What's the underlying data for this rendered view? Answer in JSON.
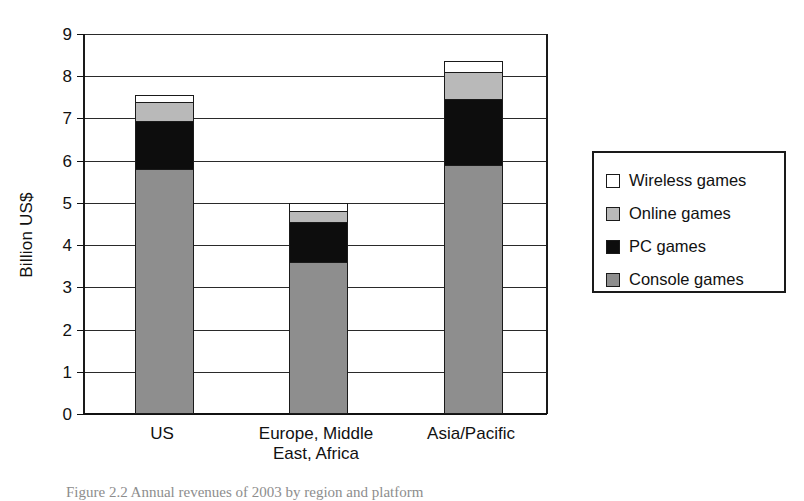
{
  "chart": {
    "type": "bar",
    "ylabel": "Billion US$",
    "caption": "Figure 2.2  Annual revenues of 2003 by region and platform"
  },
  "axis": {
    "ticks": [
      "9",
      "8",
      "7",
      "6",
      "5",
      "4",
      "3",
      "2",
      "1",
      "0"
    ]
  },
  "legend": {
    "items": [
      {
        "label": "Wireless games",
        "swatch": "swatch-wireless",
        "color": "#ffffff"
      },
      {
        "label": "Online games",
        "swatch": "swatch-online",
        "color": "#b9b9b9"
      },
      {
        "label": "PC games",
        "swatch": "swatch-pc",
        "color": "#0d0d0d"
      },
      {
        "label": "Console games",
        "swatch": "swatch-console",
        "color": "#8e8e8e"
      }
    ]
  },
  "categories": [
    {
      "label": "US"
    },
    {
      "label": "Europe, Middle\nEast, Africa"
    },
    {
      "label": "Asia/Pacific"
    }
  ],
  "chart_data": {
    "type": "bar",
    "subtype": "stacked",
    "title": "",
    "xlabel": "",
    "ylabel": "Billion US$",
    "ylim": [
      0,
      9
    ],
    "ytick_step": 1,
    "grid": true,
    "legend_position": "right",
    "categories": [
      "US",
      "Europe, Middle East, Africa",
      "Asia/Pacific"
    ],
    "series": [
      {
        "name": "Console games",
        "color": "#8e8e8e",
        "values": [
          5.8,
          3.6,
          5.9
        ]
      },
      {
        "name": "PC games",
        "color": "#0d0d0d",
        "values": [
          1.15,
          0.95,
          1.55
        ]
      },
      {
        "name": "Online games",
        "color": "#b9b9b9",
        "values": [
          0.45,
          0.25,
          0.65
        ]
      },
      {
        "name": "Wireless games",
        "color": "#ffffff",
        "values": [
          0.15,
          0.2,
          0.25
        ]
      }
    ],
    "totals": [
      7.55,
      5.0,
      8.35
    ]
  }
}
